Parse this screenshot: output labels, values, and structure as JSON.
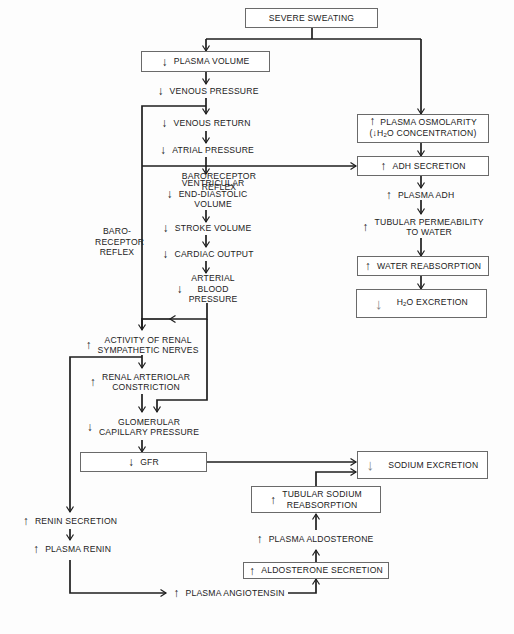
{
  "diagram": {
    "title_node": "SEVERE SWEATING",
    "arrows": {
      "up": "↑",
      "down": "↓"
    },
    "left_chain": [
      {
        "id": "plasma_volume",
        "dir": "down",
        "label": "PLASMA VOLUME",
        "boxed": true
      },
      {
        "id": "venous_pressure",
        "dir": "down",
        "label": "VENOUS PRESSURE"
      },
      {
        "id": "venous_return",
        "dir": "down",
        "label": "VENOUS RETURN"
      },
      {
        "id": "atrial_pressure",
        "dir": "down",
        "label": "ATRIAL PRESSURE"
      },
      {
        "id": "ved_volume",
        "dir": "down",
        "label_lines": [
          "VENTRICULAR",
          "END-DIASTOLIC",
          "VOLUME"
        ]
      },
      {
        "id": "stroke_volume",
        "dir": "down",
        "label": "STROKE VOLUME"
      },
      {
        "id": "cardiac_output",
        "dir": "down",
        "label": "CARDIAC OUTPUT"
      },
      {
        "id": "arterial_bp",
        "dir": "down",
        "label_lines": [
          "ARTERIAL",
          "BLOOD",
          "PRESSURE"
        ]
      }
    ],
    "right_chain": [
      {
        "id": "plasma_osmolarity",
        "dir": "up",
        "label_lines": [
          "PLASMA OSMOLARITY",
          "(↓H2O CONCENTRATION)"
        ],
        "boxed": true
      },
      {
        "id": "adh_secretion",
        "dir": "up",
        "label": "ADH SECRETION",
        "boxed": true
      },
      {
        "id": "plasma_adh",
        "dir": "up",
        "label": "PLASMA ADH"
      },
      {
        "id": "tubular_permeability",
        "dir": "up",
        "label_lines": [
          "TUBULAR PERMEABILITY",
          "TO WATER"
        ]
      },
      {
        "id": "water_reabsorption",
        "dir": "up",
        "label": "WATER REABSORPTION",
        "boxed": true
      },
      {
        "id": "h2o_excretion",
        "dir": "down",
        "label": "H2O EXCRETION",
        "boxed": true,
        "emphasis": true
      }
    ],
    "renal_chain": [
      {
        "id": "renal_sympathetic",
        "dir": "up",
        "label_lines": [
          "ACTIVITY OF RENAL",
          "SYMPATHETIC NERVES"
        ]
      },
      {
        "id": "renal_arteriolar",
        "dir": "up",
        "label_lines": [
          "RENAL ARTERIOLAR",
          "CONSTRICTION"
        ]
      },
      {
        "id": "glomerular_cp",
        "dir": "down",
        "label_lines": [
          "GLOMERULAR",
          "CAPILLARY PRESSURE"
        ]
      },
      {
        "id": "gfr",
        "dir": "down",
        "label": "GFR",
        "boxed": true
      },
      {
        "id": "sodium_excretion",
        "dir": "down",
        "label": "SODIUM EXCRETION",
        "boxed": true,
        "emphasis": true
      }
    ],
    "raas_chain": [
      {
        "id": "renin_secretion",
        "dir": "up",
        "label": "RENIN SECRETION"
      },
      {
        "id": "plasma_renin",
        "dir": "up",
        "label": "PLASMA RENIN"
      },
      {
        "id": "plasma_angiotensin",
        "dir": "up",
        "label": "PLASMA ANGIOTENSIN"
      },
      {
        "id": "aldosterone_secretion",
        "dir": "up",
        "label": "ALDOSTERONE SECRETION",
        "boxed": true
      },
      {
        "id": "plasma_aldosterone",
        "dir": "up",
        "label": "PLASMA ALDOSTERONE"
      },
      {
        "id": "tubular_sodium",
        "dir": "up",
        "label_lines": [
          "TUBULAR SODIUM",
          "REABSORPTION"
        ],
        "boxed": true
      }
    ],
    "edge_labels": {
      "baroreceptor_horizontal": [
        "BARORECEPTOR",
        "REFLEX"
      ],
      "baroreceptor_vertical": [
        "BARO-",
        "RECEPTOR",
        "REFLEX"
      ]
    },
    "colors": {
      "line": "#1e1e1e",
      "box_border": "#6a6a6a",
      "background": "#fdfdfd"
    }
  }
}
